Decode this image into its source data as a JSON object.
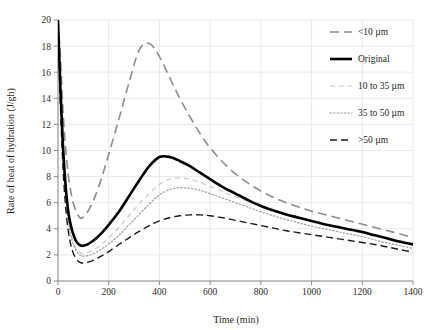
{
  "chart_data": {
    "type": "line",
    "title": "",
    "xlabel": "Time (min)",
    "ylabel": "Rate of heat of hydration (J/gh)",
    "xlim": [
      0,
      1400
    ],
    "ylim": [
      0,
      20
    ],
    "xticks": [
      0,
      200,
      400,
      600,
      800,
      1000,
      1200,
      1400
    ],
    "yticks": [
      0,
      2,
      4,
      6,
      8,
      10,
      12,
      14,
      16,
      18,
      20
    ],
    "grid": true,
    "legend_position": "upper right",
    "x": [
      0,
      10,
      20,
      30,
      40,
      50,
      60,
      70,
      80,
      90,
      100,
      120,
      140,
      160,
      180,
      200,
      240,
      280,
      320,
      360,
      400,
      440,
      480,
      520,
      560,
      600,
      650,
      700,
      750,
      800,
      850,
      900,
      950,
      1000,
      1050,
      1100,
      1150,
      1200,
      1250,
      1300,
      1350,
      1400
    ],
    "series": [
      {
        "name": "<10 µm",
        "color": "#8d8d8d",
        "linestyle": "long-dash",
        "linewidth": 1.6,
        "values": [
          20.0,
          17.0,
          13.0,
          10.2,
          8.2,
          6.9,
          6.0,
          5.4,
          5.0,
          4.8,
          4.9,
          5.4,
          6.2,
          7.2,
          8.4,
          9.7,
          12.4,
          15.2,
          17.7,
          18.2,
          17.2,
          15.6,
          14.0,
          12.6,
          11.3,
          10.2,
          9.1,
          8.2,
          7.5,
          6.9,
          6.4,
          6.0,
          5.65,
          5.35,
          5.1,
          4.85,
          4.6,
          4.35,
          4.1,
          3.85,
          3.6,
          3.3
        ]
      },
      {
        "name": "Original",
        "color": "#000000",
        "linestyle": "solid",
        "linewidth": 2.6,
        "values": [
          20.0,
          14.5,
          10.2,
          7.3,
          5.4,
          4.3,
          3.6,
          3.1,
          2.85,
          2.72,
          2.7,
          2.85,
          3.1,
          3.45,
          3.85,
          4.3,
          5.3,
          6.5,
          7.7,
          8.8,
          9.5,
          9.5,
          9.2,
          8.8,
          8.3,
          7.8,
          7.2,
          6.7,
          6.2,
          5.75,
          5.4,
          5.1,
          4.85,
          4.6,
          4.35,
          4.15,
          3.95,
          3.75,
          3.5,
          3.25,
          3.0,
          2.8
        ]
      },
      {
        "name": "10 to 35 µm",
        "color": "#c9c9c9",
        "linestyle": "short-dash",
        "linewidth": 1.2,
        "values": [
          20.0,
          14.0,
          9.6,
          6.7,
          4.9,
          3.7,
          3.0,
          2.55,
          2.3,
          2.15,
          2.1,
          2.2,
          2.4,
          2.65,
          2.95,
          3.3,
          4.1,
          5.0,
          5.9,
          6.7,
          7.4,
          7.8,
          7.9,
          7.8,
          7.55,
          7.25,
          6.85,
          6.45,
          6.1,
          5.75,
          5.4,
          5.1,
          4.85,
          4.6,
          4.35,
          4.1,
          3.9,
          3.7,
          3.5,
          3.3,
          3.1,
          2.9
        ]
      },
      {
        "name": "35 to 50 µm",
        "color": "#9e9e9e",
        "linestyle": "dotted",
        "linewidth": 1.2,
        "values": [
          20.0,
          13.8,
          9.4,
          6.5,
          4.7,
          3.5,
          2.85,
          2.4,
          2.1,
          1.95,
          1.9,
          1.95,
          2.1,
          2.3,
          2.55,
          2.85,
          3.5,
          4.3,
          5.1,
          5.9,
          6.6,
          7.0,
          7.15,
          7.1,
          6.95,
          6.7,
          6.35,
          6.0,
          5.65,
          5.3,
          5.0,
          4.7,
          4.45,
          4.2,
          4.0,
          3.8,
          3.6,
          3.4,
          3.15,
          2.9,
          2.7,
          2.5
        ]
      },
      {
        "name": ">50 µm",
        "color": "#1a1a1a",
        "linestyle": "dash-gap",
        "linewidth": 1.4,
        "values": [
          20.0,
          13.2,
          8.6,
          5.7,
          3.9,
          2.8,
          2.15,
          1.75,
          1.52,
          1.4,
          1.38,
          1.45,
          1.6,
          1.8,
          2.0,
          2.25,
          2.8,
          3.3,
          3.8,
          4.25,
          4.6,
          4.85,
          5.0,
          5.07,
          5.07,
          5.0,
          4.85,
          4.65,
          4.45,
          4.25,
          4.05,
          3.85,
          3.7,
          3.55,
          3.4,
          3.25,
          3.1,
          2.95,
          2.8,
          2.6,
          2.4,
          2.2
        ]
      }
    ]
  },
  "legend": {
    "items": [
      {
        "label": "<10 µm"
      },
      {
        "label": "Original"
      },
      {
        "label": "10 to 35 µm"
      },
      {
        "label": "35 to 50 µm"
      },
      {
        "label": ">50 µm"
      }
    ]
  },
  "colors": {
    "grid": "#e9e9e9",
    "axis": "#8a8a8a",
    "text": "#1f1f1f",
    "background": "#ffffff"
  }
}
